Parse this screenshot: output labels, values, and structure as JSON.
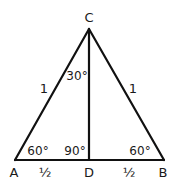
{
  "diagram": {
    "colors": {
      "stroke": "#111111",
      "text": "#1a1a1a",
      "background": "#ffffff"
    },
    "vertices": {
      "C": {
        "label": "C",
        "x": 89,
        "y": 29
      },
      "A": {
        "label": "A",
        "x": 15,
        "y": 160
      },
      "B": {
        "label": "B",
        "x": 164,
        "y": 160
      },
      "D": {
        "label": "D",
        "x": 89,
        "y": 160
      }
    },
    "segments": [
      {
        "from": "A",
        "to": "C"
      },
      {
        "from": "C",
        "to": "B"
      },
      {
        "from": "A",
        "to": "B"
      },
      {
        "from": "C",
        "to": "D"
      }
    ],
    "side_labels": {
      "AC": "1",
      "CB": "1",
      "AD": "½",
      "DB": "½"
    },
    "angle_labels": {
      "A": "60°",
      "B": "60°",
      "ADC": "90°",
      "ACD": "30°"
    }
  }
}
